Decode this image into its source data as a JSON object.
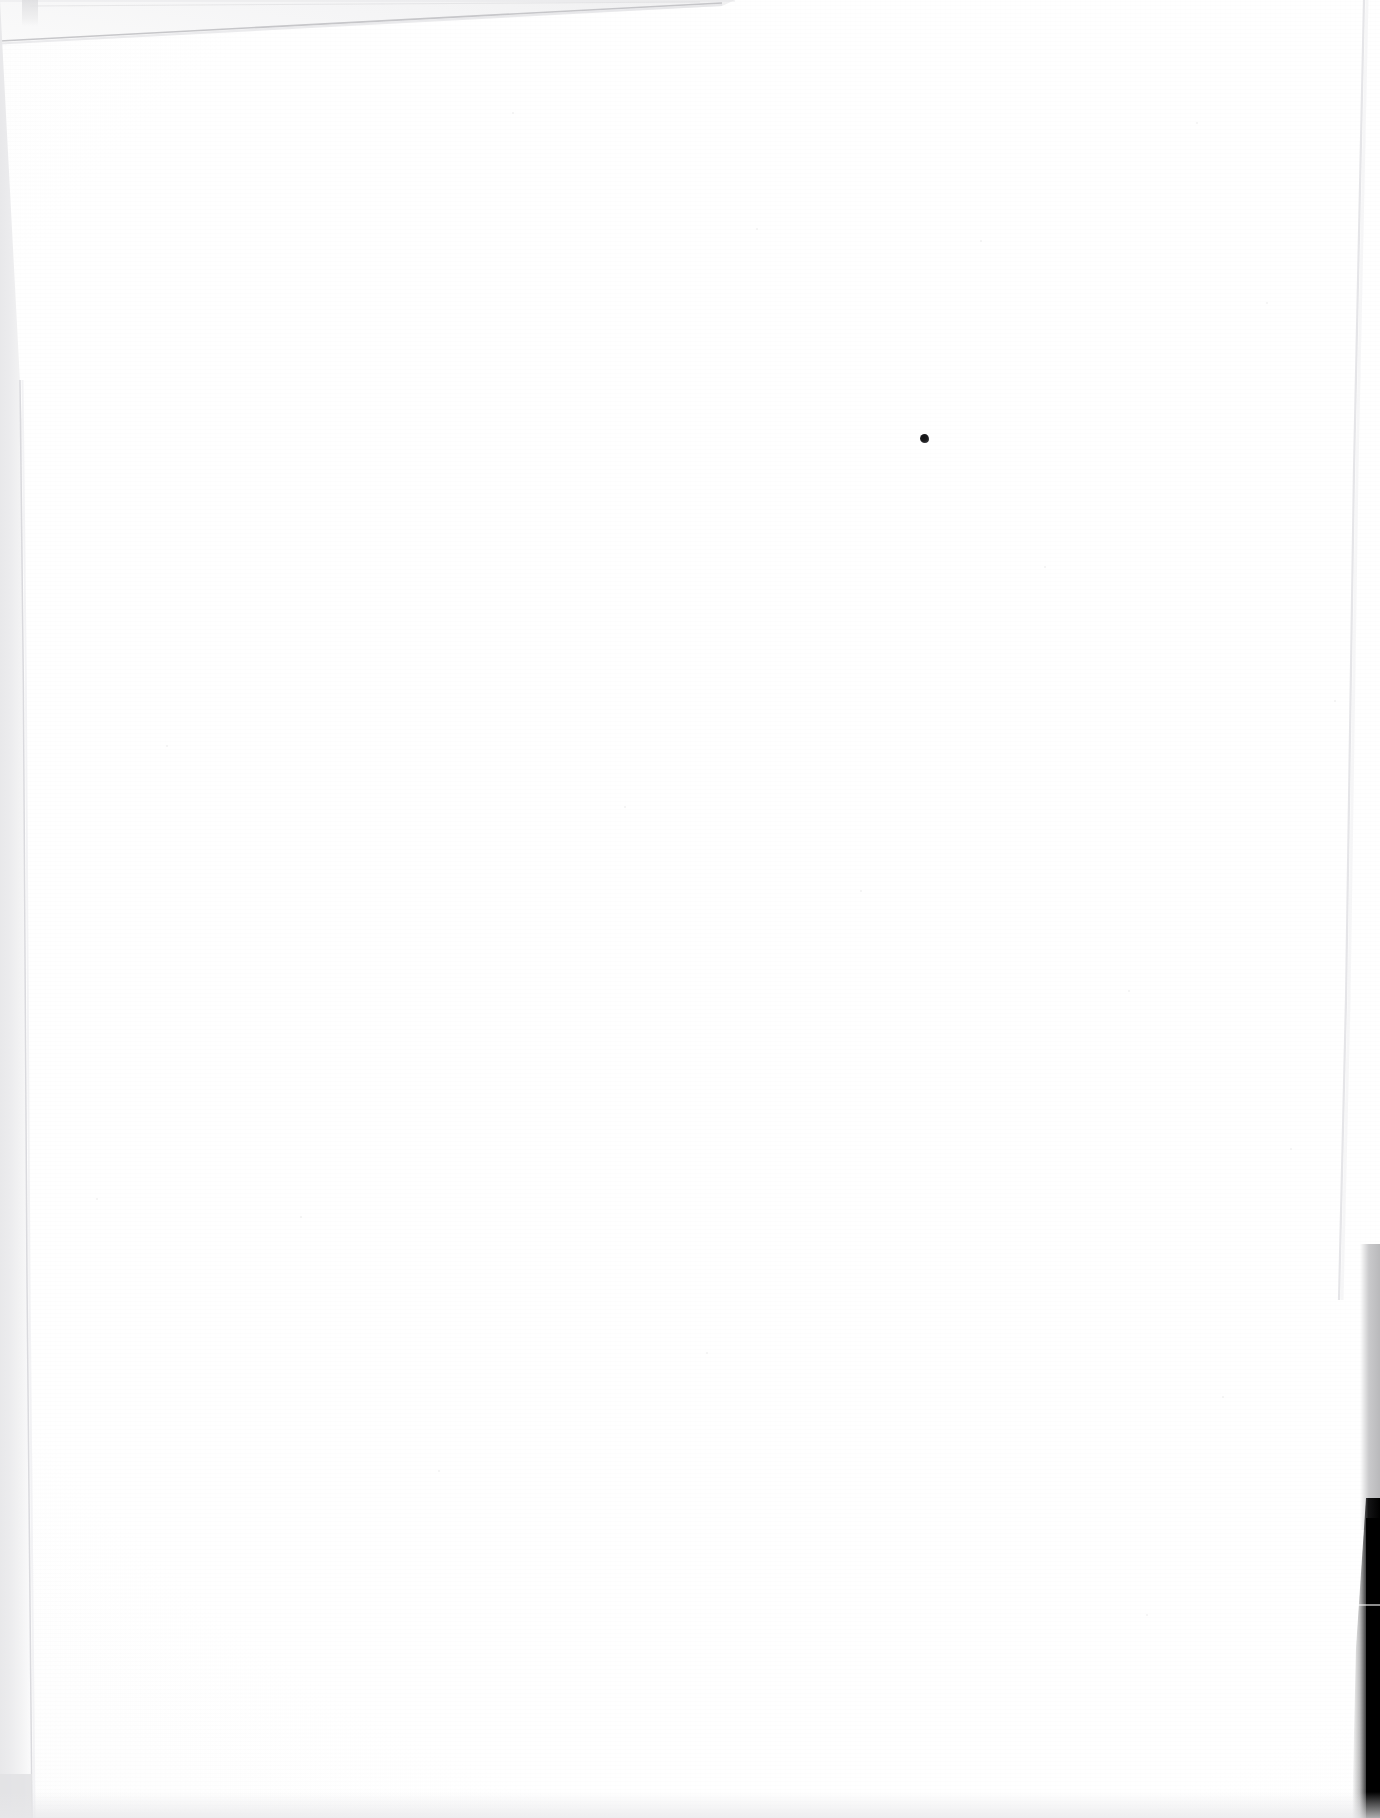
{
  "document": {
    "kind": "scanned-page",
    "description": "Blank scanned sheet of white paper",
    "width_px": 1380,
    "height_px": 1818,
    "page_text": "",
    "visible_text_content": "none",
    "orientation": "portrait",
    "background_color": "#ffffff"
  },
  "artifacts": {
    "top_edge": {
      "name": "slanted page edge",
      "label": "",
      "from_x": 0,
      "from_y": 40,
      "to_x": 722,
      "to_y": 3,
      "color": "#c9c9cc"
    },
    "left_band": {
      "name": "left scanner bed band",
      "label": "",
      "x": 0,
      "width": 34,
      "color": "#e7e7e9"
    },
    "right_edge": {
      "name": "right page edge line",
      "label": "",
      "x": 1344,
      "color": "#e0e0e3"
    },
    "right_grey_band": {
      "name": "right scanner bed band",
      "label": "",
      "top": 1244,
      "height": 286,
      "color": "#bcbcbe"
    },
    "right_black_band": {
      "name": "scanner void",
      "label": "",
      "top": 1498,
      "height": 320,
      "color": "#000000"
    },
    "bottom_band": {
      "name": "bottom shadow band",
      "label": "",
      "height": 26,
      "color": "#e8e8ea"
    }
  },
  "marks": {
    "ink_speck": {
      "name": "ink speck",
      "label": "",
      "x": 920,
      "y": 434,
      "diameter_px": 9,
      "color": "#1a1a1c"
    },
    "dust": [
      {
        "x": 166,
        "y": 745
      },
      {
        "x": 512,
        "y": 112
      },
      {
        "x": 624,
        "y": 806
      },
      {
        "x": 756,
        "y": 228
      },
      {
        "x": 860,
        "y": 890
      },
      {
        "x": 980,
        "y": 240
      },
      {
        "x": 1044,
        "y": 566
      },
      {
        "x": 1128,
        "y": 990
      },
      {
        "x": 1196,
        "y": 122
      },
      {
        "x": 1222,
        "y": 1396
      },
      {
        "x": 1266,
        "y": 302
      },
      {
        "x": 1290,
        "y": 1148
      },
      {
        "x": 438,
        "y": 1470
      },
      {
        "x": 300,
        "y": 1216
      },
      {
        "x": 706,
        "y": 1352
      },
      {
        "x": 96,
        "y": 1198
      },
      {
        "x": 1334,
        "y": 700
      },
      {
        "x": 1146,
        "y": 1614
      }
    ]
  }
}
